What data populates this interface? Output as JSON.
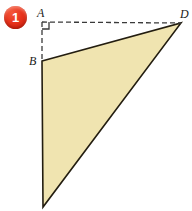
{
  "figure": {
    "type": "geometry-diagram",
    "badge": {
      "number": "1",
      "color": "#e8331c",
      "text_color": "#ffffff"
    },
    "labels": {
      "a": "A",
      "b": "B",
      "d": "D"
    },
    "colors": {
      "shape_fill": "#f0e4b0",
      "shape_stroke": "#231d10",
      "dashed_line": "#3a3a3a",
      "label_text": "#1a1a1a",
      "background": "#ffffff"
    },
    "points": {
      "A": {
        "x": 42,
        "y": 22
      },
      "B": {
        "x": 42,
        "y": 61
      },
      "D": {
        "x": 181,
        "y": 23
      },
      "C": {
        "x": 43,
        "y": 207
      }
    },
    "right_angle_marker": {
      "at": "A",
      "size": 7
    },
    "dashed_segments": [
      {
        "from": "A",
        "to": "D"
      },
      {
        "from": "A",
        "to": "B"
      }
    ],
    "solid_shape": {
      "kind": "triangle",
      "vertices": [
        "B",
        "D",
        "C"
      ]
    }
  }
}
